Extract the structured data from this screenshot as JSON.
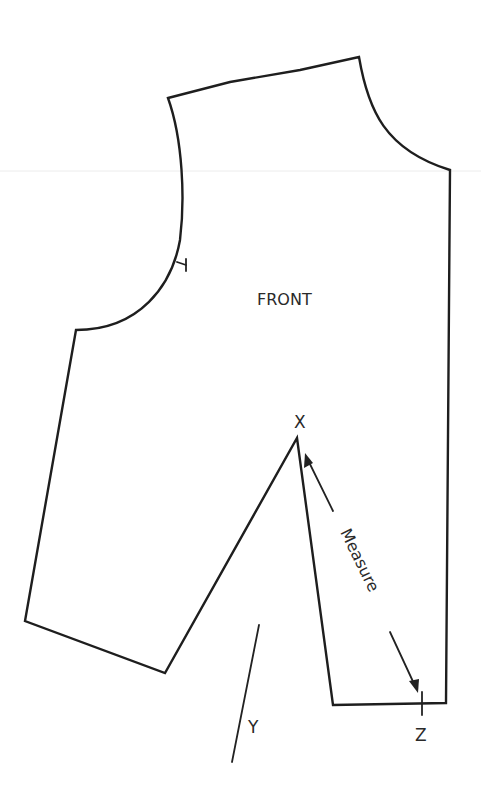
{
  "diagram": {
    "type": "sewing-pattern",
    "piece_label": "FRONT",
    "point_labels": {
      "apex": "X",
      "left_dart_leg": "Y",
      "right_dart_leg": "Z"
    },
    "annotation": "Measure",
    "colors": {
      "line": "#1e1e1e",
      "background": "#ffffff"
    }
  }
}
